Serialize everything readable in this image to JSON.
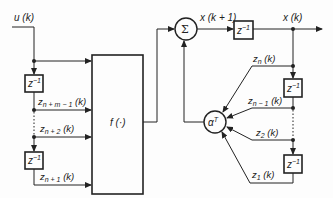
{
  "diagram": {
    "input_label": "u (k)",
    "function_block": {
      "label": "f (·)"
    },
    "sum_node": {
      "symbol": "Σ"
    },
    "gain_node": {
      "symbol": "α",
      "superscript": "T"
    },
    "delay_block": {
      "base": "z",
      "exponent": "−1"
    },
    "state_next_label": "x (k + 1)",
    "output_label": "x (k)",
    "left_chain": {
      "signals": [
        {
          "sub": "n + m − 1",
          "suffix": " (k)"
        },
        {
          "sub": "n + 2",
          "suffix": " (k)"
        },
        {
          "sub": "n + 1",
          "suffix": " (k)"
        }
      ]
    },
    "right_chain": {
      "signals": [
        {
          "sub": "n",
          "suffix": " (k)"
        },
        {
          "sub": "n − 1",
          "suffix": " (k)"
        },
        {
          "sub": "2",
          "suffix": " (k)"
        },
        {
          "sub": "1",
          "suffix": " (k)"
        }
      ]
    },
    "colors": {
      "ink": "#222222",
      "background": "#fdfdfd"
    }
  }
}
